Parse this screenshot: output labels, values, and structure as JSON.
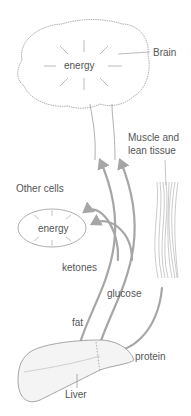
{
  "labels": {
    "brain": "Brain",
    "brain_energy": "energy",
    "muscle_line1": "Muscle and",
    "muscle_line2": "lean tissue",
    "other_cells": "Other cells",
    "cell_energy": "energy",
    "ketones": "ketones",
    "glucose": "glucose",
    "fat": "fat",
    "protein": "protein",
    "liver": "Liver"
  },
  "colors": {
    "arrow": "#a6a6a6",
    "outline": "#9a9a9a",
    "text": "#555555"
  }
}
